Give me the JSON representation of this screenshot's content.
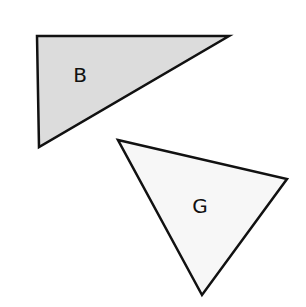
{
  "shapes": [
    {
      "label": "B",
      "points": "37,36 229,36 39,147",
      "fill": "#dcdcdc",
      "stroke": "#111111",
      "label_x": 80,
      "label_y": 82
    },
    {
      "label": "G",
      "points": "118,140 287,179 202,295",
      "fill": "#f7f7f7",
      "stroke": "#111111",
      "label_x": 200,
      "label_y": 213
    }
  ]
}
